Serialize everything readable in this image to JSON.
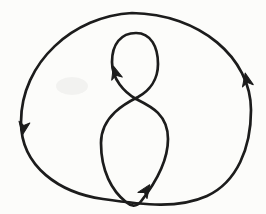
{
  "page": {
    "background_color": "#fcfcfa"
  },
  "figure": {
    "canvas": {
      "width": 266,
      "height": 214
    },
    "stroke_color": "#1c1c1c",
    "stroke_width": 2.7,
    "curves": [
      {
        "name": "outer-ellipse-curve",
        "path": "M 132,13 C 74,16 21,62 21,122 C 21,167 60,193 103,199 C 145,205 178,209 207,196 C 237,182 251,148 251,110 C 251,58 200,14 132,13 Z"
      },
      {
        "name": "figure-eight-curve",
        "path": "M 136,99 C 124,92 112,79 112,62 C 112,44 121,33 136,33 C 151,33 158,47 158,64 C 158,80 149,91 138,97 C 126,103 101,116 101,143 C 101,171 112,191 126,202 C 131,206.5 136.5,207 140.5,202 C 150,190 168,166 168,139 C 168,114 150,106 136,99"
      }
    ],
    "arrowhead_points": "4,0 -9,5.5 -5.5,0 -9,-5.5",
    "arrows": [
      {
        "name": "arrowhead-outer-ellipse-left-down",
        "x": 23,
        "y": 131,
        "angle": 99
      },
      {
        "name": "arrowhead-outer-ellipse-right-up",
        "x": 246,
        "y": 77,
        "angle": -102
      },
      {
        "name": "arrowhead-eight-top-loop-up",
        "x": 114.5,
        "y": 70,
        "angle": -106
      },
      {
        "name": "arrowhead-eight-bottom-loop-upright",
        "x": 147.5,
        "y": 188,
        "angle": -56
      }
    ],
    "smudge": {
      "x": 72,
      "y": 86,
      "rx": 16,
      "ry": 9,
      "color": "rgba(120,120,115,0.07)"
    }
  }
}
